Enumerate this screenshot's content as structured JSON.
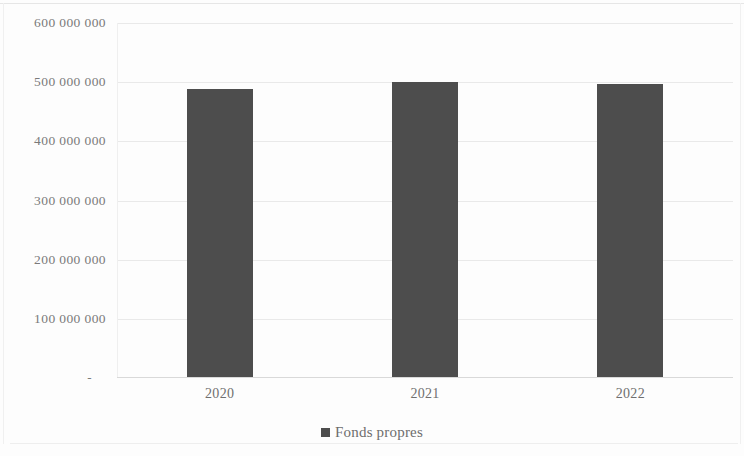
{
  "chart_data": {
    "type": "bar",
    "title": "",
    "subtitle": "",
    "xlabel": "",
    "ylabel": "",
    "categories": [
      "2020",
      "2021",
      "2022"
    ],
    "series": [
      {
        "name": "Fonds propres",
        "values": [
          486000000,
          498000000,
          495000000
        ],
        "color": "#4d4d4d"
      }
    ],
    "ylim": [
      0,
      600000000
    ],
    "ytick_values": [
      0,
      100000000,
      200000000,
      300000000,
      400000000,
      500000000,
      600000000
    ],
    "ytick_labels": [
      "-",
      "100 000 000",
      "200 000 000",
      "300 000 000",
      "400 000 000",
      "500 000 000",
      "600 000 000"
    ],
    "grid": true,
    "grid_axis": "y",
    "legend": {
      "position": "bottom",
      "entries": [
        {
          "label": "Fonds propres",
          "marker": "square",
          "color": "#4d4d4d"
        }
      ]
    },
    "background_color": "#ffffff",
    "gridline_color": "#e9e9e9",
    "axis_text_color": "#7a7a7a"
  }
}
